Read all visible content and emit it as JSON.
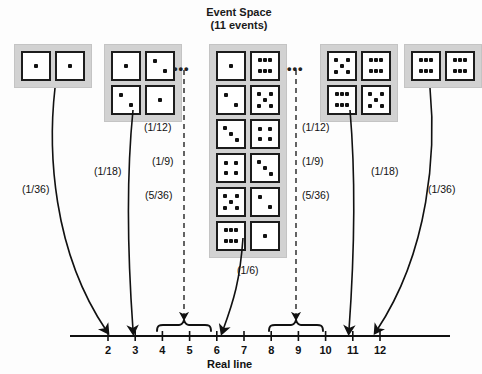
{
  "title": {
    "line1": "Event Space",
    "line2": "(11 events)"
  },
  "axis": {
    "name": "Real line",
    "ticks": [
      "2",
      "3",
      "4",
      "5",
      "6",
      "7",
      "8",
      "9",
      "10",
      "11",
      "12"
    ]
  },
  "ellipses": {
    "left": "•••",
    "right": "•••"
  },
  "probabilities": {
    "sum2": "(1/36)",
    "sum3": "(1/18)",
    "sum4": "(1/12)",
    "sum5": "(1/9)",
    "sum6": "(5/36)",
    "sum7": "(1/6)",
    "sum8": "(5/36)",
    "sum9": "(1/9)",
    "sum10": "(1/12)",
    "sum11": "(1/18)",
    "sum12": "(1/36)"
  },
  "event_groups": [
    {
      "name": "sum-2",
      "sum": 2,
      "outcomes": [
        [
          1,
          1
        ]
      ]
    },
    {
      "name": "sum-3",
      "sum": 3,
      "outcomes": [
        [
          1,
          2
        ],
        [
          2,
          1
        ]
      ]
    },
    {
      "name": "sum-7",
      "sum": 7,
      "outcomes": [
        [
          1,
          6
        ],
        [
          2,
          5
        ],
        [
          3,
          4
        ],
        [
          4,
          3
        ],
        [
          5,
          2
        ],
        [
          6,
          1
        ]
      ]
    },
    {
      "name": "sum-11",
      "sum": 11,
      "outcomes": [
        [
          5,
          6
        ],
        [
          6,
          5
        ]
      ]
    },
    {
      "name": "sum-12",
      "sum": 12,
      "outcomes": [
        [
          6,
          6
        ]
      ]
    }
  ],
  "colors": {
    "group_background": "#d2d2d2",
    "die_face": "#ffffff",
    "die_border": "#1c1c1c",
    "pip": "#111111",
    "line": "#111111"
  }
}
